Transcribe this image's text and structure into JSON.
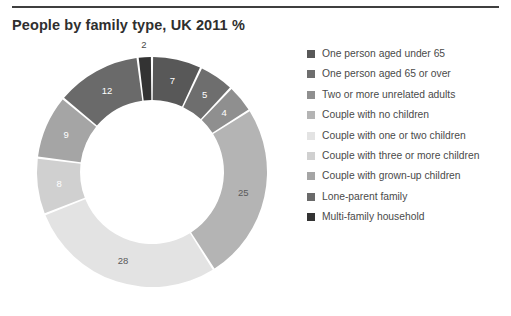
{
  "chart_data": {
    "type": "pie",
    "variant": "donut",
    "title": "People by family type, UK 2011 %",
    "unit": "%",
    "categories": [
      "One person aged under 65",
      "One person aged 65 or over",
      "Two or more unrelated adults",
      "Couple with no children",
      "Couple with one or two children",
      "Couple with three or more children",
      "Couple with grown-up children",
      "Lone-parent family",
      "Multi-family household"
    ],
    "values": [
      7,
      5,
      4,
      25,
      28,
      8,
      9,
      12,
      2
    ],
    "data_labels": [
      "7",
      "5",
      "4",
      "25",
      "28",
      "8",
      "9",
      "12",
      "2"
    ],
    "colors": [
      "#585858",
      "#6e6e6e",
      "#8f8f8f",
      "#b4b4b4",
      "#e3e3e3",
      "#d0d0d0",
      "#a5a5a5",
      "#6a6a6a",
      "#333333"
    ],
    "label_colors": [
      "#ffffff",
      "#ffffff",
      "#ffffff",
      "#5a5a5a",
      "#5a5a5a",
      "#ffffff",
      "#ffffff",
      "#ffffff",
      "#4a4a4a"
    ],
    "total": 100,
    "start_angle_deg": 0,
    "direction": "clockwise",
    "legend_position": "right",
    "grid": false,
    "rule_color": "#3f3f3f",
    "title_color": "#2f2f2f",
    "legend_text_color": "#4a4a4a",
    "background": "#ffffff"
  },
  "legend": {
    "items": [
      {
        "label": "One person aged under 65"
      },
      {
        "label": "One person aged 65 or over"
      },
      {
        "label": "Two or more unrelated adults"
      },
      {
        "label": "Couple with no children"
      },
      {
        "label": "Couple with one or two children"
      },
      {
        "label": "Couple with three or more children"
      },
      {
        "label": "Couple with grown-up children"
      },
      {
        "label": "Lone-parent family"
      },
      {
        "label": "Multi-family household"
      }
    ]
  }
}
